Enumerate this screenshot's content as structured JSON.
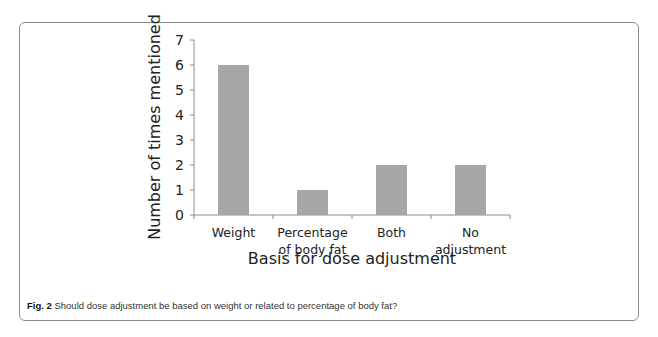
{
  "figure": {
    "label": "Fig. 2",
    "caption": "Should dose adjustment be based on weight or related to percentage of body fat?"
  },
  "chart_data": {
    "type": "bar",
    "title": "",
    "xlabel": "Basis for dose adjustment",
    "ylabel": "Number of times mentioned",
    "categories": [
      "Weight",
      "Percentage of body fat",
      "Both",
      "No adjustment"
    ],
    "category_lines": [
      [
        "Weight"
      ],
      [
        "Percentage",
        "of body fat"
      ],
      [
        "Both"
      ],
      [
        "No",
        "adjustment"
      ]
    ],
    "values": [
      6,
      1,
      2,
      2
    ],
    "ylim": [
      0,
      7
    ],
    "yticks": [
      0,
      1,
      2,
      3,
      4,
      5,
      6,
      7
    ],
    "grid": false,
    "legend": null,
    "bar_color": "#a6a6a6"
  }
}
